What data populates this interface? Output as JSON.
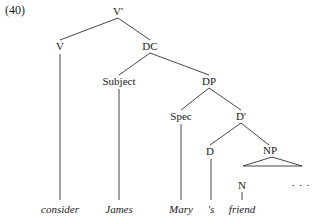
{
  "example_number": "(40)",
  "tree": {
    "nodes": {
      "vbar": "V'",
      "v": "V",
      "dc": "DC",
      "subject": "Subject",
      "dp": "DP",
      "spec": "Spec",
      "dbar": "D'",
      "d": "D",
      "np": "NP",
      "n": "N",
      "ellipsis": ". . ."
    },
    "leaves": {
      "consider": "consider",
      "james": "James",
      "mary": "Mary",
      "poss": "'s",
      "friend": "friend"
    }
  }
}
